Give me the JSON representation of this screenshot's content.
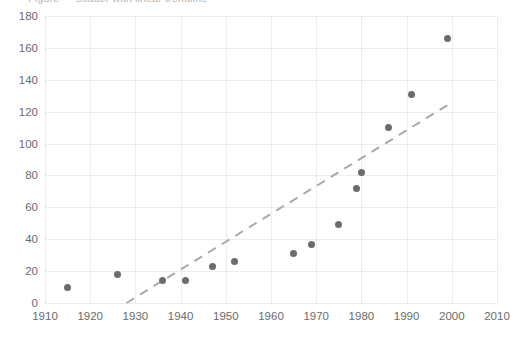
{
  "title": {
    "clipped_text": "Figure — scatter with linear trendline",
    "visible": true
  },
  "axes": {
    "y_ticks": [
      "0",
      "20",
      "40",
      "60",
      "80",
      "100",
      "120",
      "140",
      "160",
      "180"
    ],
    "x_ticks": [
      "1910",
      "1920",
      "1930",
      "1940",
      "1950",
      "1960",
      "1970",
      "1980",
      "1990",
      "2000",
      "2010"
    ],
    "xlabel": "",
    "ylabel": ""
  },
  "colors": {
    "marker": "#6c6c6c",
    "trendline": "#aaaaaa",
    "grid": "#ededed",
    "axis": "#cfcfcf",
    "tick_text": "#6b6b6b",
    "background": "#ffffff"
  },
  "chart_data": {
    "type": "scatter",
    "title": "",
    "xlabel": "",
    "ylabel": "",
    "xlim": [
      1910,
      2010
    ],
    "ylim": [
      0,
      180
    ],
    "xticks": [
      1910,
      1920,
      1930,
      1940,
      1950,
      1960,
      1970,
      1980,
      1990,
      2000,
      2010
    ],
    "yticks": [
      0,
      20,
      40,
      60,
      80,
      100,
      120,
      140,
      160,
      180
    ],
    "grid": true,
    "legend": "none",
    "series": [
      {
        "name": "observations",
        "marker": "circle",
        "color": "#6c6c6c",
        "points": [
          {
            "x": 1915,
            "y": 10
          },
          {
            "x": 1926,
            "y": 18
          },
          {
            "x": 1936,
            "y": 14
          },
          {
            "x": 1941,
            "y": 14
          },
          {
            "x": 1947,
            "y": 23
          },
          {
            "x": 1952,
            "y": 26
          },
          {
            "x": 1965,
            "y": 31
          },
          {
            "x": 1969,
            "y": 37
          },
          {
            "x": 1975,
            "y": 49
          },
          {
            "x": 1979,
            "y": 72
          },
          {
            "x": 1980,
            "y": 82
          },
          {
            "x": 1986,
            "y": 110
          },
          {
            "x": 1991,
            "y": 131
          },
          {
            "x": 1999,
            "y": 166
          }
        ]
      },
      {
        "name": "linear trendline",
        "type": "line",
        "style": "dashed",
        "color": "#aaaaaa",
        "endpoints": [
          {
            "x": 1928,
            "y": 0
          },
          {
            "x": 1999,
            "y": 124
          }
        ]
      }
    ]
  }
}
